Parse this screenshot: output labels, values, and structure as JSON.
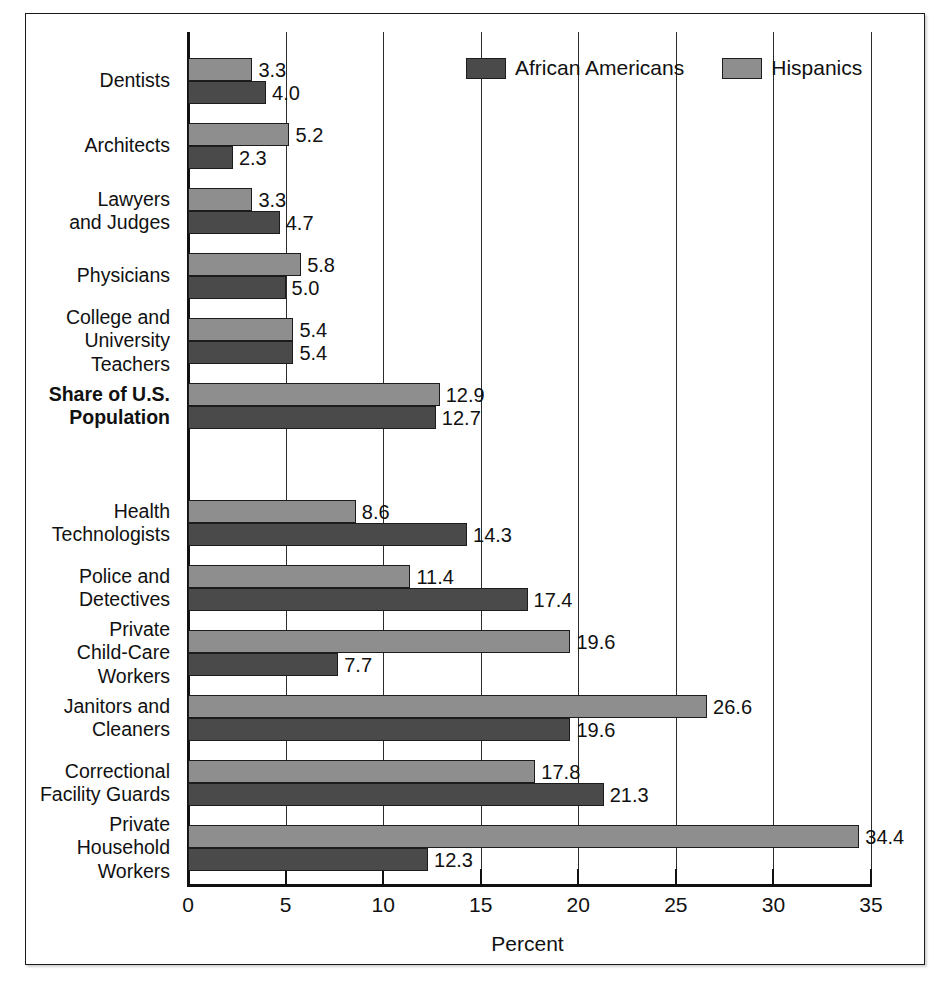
{
  "chart_data": {
    "type": "bar",
    "orientation": "horizontal",
    "title": "",
    "xlabel": "Percent",
    "ylabel": "",
    "xlim": [
      0,
      35
    ],
    "xticks": [
      0,
      5,
      10,
      15,
      20,
      25,
      30,
      35
    ],
    "xtick_labels": [
      "0",
      "5",
      "10",
      "15",
      "20",
      "25",
      "30",
      "35"
    ],
    "grid": true,
    "legend_position": "top-right",
    "categories": [
      "Dentists",
      "Architects",
      "Lawyers\nand Judges",
      "Physicians",
      "College and\nUniversity\nTeachers",
      "Share of U.S.\nPopulation",
      "Health\nTechnologists",
      "Police and\nDetectives",
      "Private\nChild-Care\nWorkers",
      "Janitors and\nCleaners",
      "Correctional\nFacility Guards",
      "Private\nHousehold\nWorkers"
    ],
    "series": [
      {
        "name": "Hispanics",
        "color": "#8e8e8e",
        "values": [
          3.3,
          5.2,
          3.3,
          5.8,
          5.4,
          12.9,
          8.6,
          11.4,
          19.6,
          26.6,
          17.8,
          34.4
        ],
        "value_labels": [
          "3.3",
          "5.2",
          "3.3",
          "5.8",
          "5.4",
          "12.9",
          "8.6",
          "11.4",
          "19.6",
          "26.6",
          "17.8",
          "34.4"
        ]
      },
      {
        "name": "African Americans",
        "color": "#4a4a4a",
        "values": [
          4.0,
          2.3,
          4.7,
          5.0,
          5.4,
          12.7,
          14.3,
          17.4,
          7.7,
          19.6,
          21.3,
          12.3
        ],
        "value_labels": [
          "4.0",
          "2.3",
          "4.7",
          "5.0",
          "5.4",
          "12.7",
          "14.3",
          "17.4",
          "7.7",
          "19.6",
          "21.3",
          "12.3"
        ]
      }
    ],
    "highlight_category": "Share of U.S.\nPopulation"
  },
  "legend": {
    "items": [
      {
        "label": "African Americans",
        "color": "#4a4a4a"
      },
      {
        "label": "Hispanics",
        "color": "#8e8e8e"
      }
    ]
  },
  "axis": {
    "x_title": "Percent",
    "ticks": [
      "0",
      "5",
      "10",
      "15",
      "20",
      "25",
      "30",
      "35"
    ]
  }
}
